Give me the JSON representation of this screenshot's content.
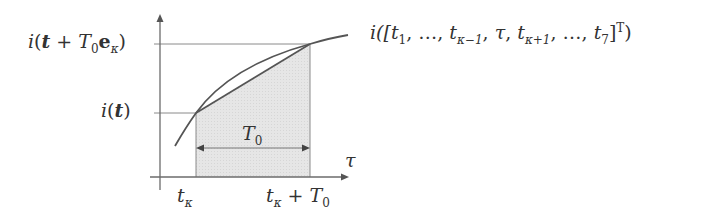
{
  "diagram": {
    "y_labels": {
      "upper": {
        "func": "i",
        "arg_bold": "t",
        "plus": " + ",
        "T": "T",
        "T_sub": "0",
        "e": "e",
        "e_sub": "κ"
      },
      "lower": {
        "func": "i",
        "arg_bold": "t"
      }
    },
    "x_axis_label": "τ",
    "x_ticks": {
      "left": {
        "t": "t",
        "sub": "κ"
      },
      "right": {
        "t": "t",
        "sub": "κ",
        "plus": " + ",
        "T": "T",
        "T_sub": "0"
      }
    },
    "interval_label": {
      "T": "T",
      "sub": "0"
    },
    "curve_label": {
      "prefix": "i([",
      "t1": "t",
      "t1_sub": "1",
      "sep1": ", …, ",
      "tkm1": "t",
      "tkm1_sub": "κ−1",
      "sep2": ", ",
      "tau": "τ",
      "sep3": ", ",
      "tkp1": "t",
      "tkp1_sub": "κ+1",
      "sep4": ", …, ",
      "t7": "t",
      "t7_sub": "7",
      "close": "]",
      "sup": "T",
      "end": ")"
    },
    "colors": {
      "axis": "#6b6b6b",
      "curve": "#555555",
      "shade": "#e3e3e3",
      "guide": "#8a8a8a"
    }
  }
}
